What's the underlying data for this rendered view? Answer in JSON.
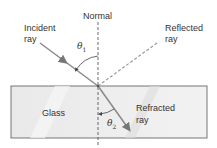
{
  "labels": {
    "normal": "Normal",
    "incident_1": "Incident",
    "incident_2": "ray",
    "reflected_1": "Reflected",
    "reflected_2": "ray",
    "glass": "Glass",
    "refracted_1": "Refracted",
    "refracted_2": "ray",
    "theta1_sym": "θ",
    "theta1_sub": "1",
    "theta2_sym": "θ",
    "theta2_sub": "2"
  },
  "colors": {
    "ray": "#8a8a8a",
    "glass_fill": "#e6e6e6",
    "glass_border": "#555555",
    "normal": "#444444"
  }
}
